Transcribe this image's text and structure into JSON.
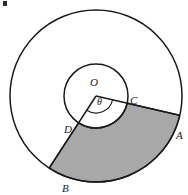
{
  "figure": {
    "name": "annular-sector-diagram",
    "background_color": "#ffffff",
    "stroke_color": "#1a1a1a",
    "shade_color": "#a8a8a8",
    "canvas": {
      "width": 188,
      "height": 195
    },
    "center": {
      "label": "O",
      "x": 96,
      "y": 96
    },
    "outer_circle": {
      "radius": 86
    },
    "inner_circle": {
      "radius": 32
    },
    "angle": {
      "symbol": "θ",
      "from_deg": 13,
      "to_deg": 123,
      "arc_radius": 17
    },
    "points": [
      {
        "label": "A",
        "on": "outer_circle",
        "angle_deg": 13,
        "text_x": 176,
        "text_y": 139
      },
      {
        "label": "B",
        "on": "outer_circle",
        "angle_deg": 123,
        "text_x": 62,
        "text_y": 192
      },
      {
        "label": "C",
        "on": "inner_circle",
        "angle_deg": 13,
        "text_x": 130,
        "text_y": 104
      },
      {
        "label": "D",
        "on": "inner_circle",
        "angle_deg": 123,
        "text_x": 64,
        "text_y": 133
      }
    ],
    "labels": {
      "center_label": "O",
      "center_label_x": 90,
      "center_label_y": 86,
      "theta_label": "θ",
      "theta_label_x": 97,
      "theta_label_y": 105,
      "point_a": "A",
      "point_b": "B",
      "point_c": "C",
      "point_d": "D"
    },
    "corner_artifact": {
      "present": true,
      "color": "#2b2b2b"
    }
  }
}
